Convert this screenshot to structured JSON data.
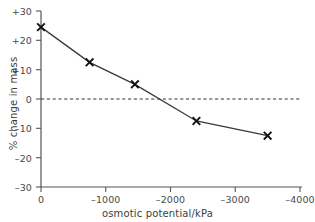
{
  "chart_data": {
    "type": "line",
    "title": "",
    "xlabel": "osmotic potential/kPa",
    "ylabel": "% change in mass",
    "xlim": [
      0,
      -4000
    ],
    "ylim": [
      -30,
      30
    ],
    "grid": false,
    "legend": "none",
    "x_ticks": [
      "0",
      "–1000",
      "–2000",
      "–3000",
      "–4000"
    ],
    "x_tick_values": [
      0,
      -1000,
      -2000,
      -3000,
      -4000
    ],
    "y_ticks": [
      "+30",
      "+20",
      "+10",
      "0",
      "–10",
      "–20",
      "–30"
    ],
    "y_tick_values": [
      30,
      20,
      10,
      0,
      -10,
      -20,
      -30
    ],
    "series": [
      {
        "name": "% change in mass",
        "marker": "x",
        "x": [
          0,
          -750,
          -1450,
          -2400,
          -3500
        ],
        "values": [
          24.5,
          12.5,
          5,
          -7.5,
          -12.5
        ]
      }
    ],
    "annotations": [
      {
        "type": "zero-reference-line",
        "axis": "y",
        "value": 0,
        "style": "dashed"
      }
    ]
  }
}
